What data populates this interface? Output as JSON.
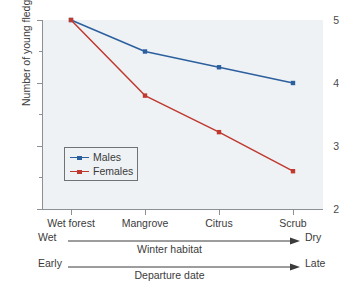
{
  "chart_data": {
    "type": "line",
    "title": "",
    "subtitle": "",
    "xlabel": "Winter habitat",
    "ylabel": "Number of young fledged",
    "categories": [
      "Wet forest",
      "Mangrove",
      "Citrus",
      "Scrub"
    ],
    "ylim": [
      2,
      5
    ],
    "yticks": [
      5,
      4,
      3,
      2
    ],
    "ytick_labels": [
      "5",
      "4",
      "3",
      "2"
    ],
    "yminor_ticks": [
      4.5,
      3.5,
      2.5
    ],
    "grid": false,
    "legend_position": "lower-left-inside",
    "series": [
      {
        "name": "Males",
        "color": "#2c5f9e",
        "values": [
          5.0,
          4.5,
          4.25,
          4.0
        ]
      },
      {
        "name": "Females",
        "color": "#c0392f",
        "values": [
          5.0,
          3.8,
          3.22,
          2.6
        ]
      }
    ],
    "annotations": [
      {
        "id": "winter-habitat",
        "start_label": "Wet",
        "end_label": "Dry",
        "mid_label": "Winter habitat"
      },
      {
        "id": "departure-date",
        "start_label": "Early",
        "end_label": "Late",
        "mid_label": "Departure date"
      }
    ]
  },
  "legend": {
    "entries": [
      {
        "label": "Males",
        "color": "#2c5f9e"
      },
      {
        "label": "Females",
        "color": "#c0392f"
      }
    ]
  },
  "axes": {
    "y_title": "Number of young fledged",
    "y_tick_labels": [
      "5",
      "4",
      "3",
      "2"
    ],
    "x_tick_labels": [
      "Wet forest",
      "Mangrove",
      "Citrus",
      "Scrub"
    ]
  },
  "annotations": {
    "habitat": {
      "start": "Wet",
      "end": "Dry",
      "middle": "Winter habitat"
    },
    "departure": {
      "start": "Early",
      "end": "Late",
      "middle": "Departure date"
    }
  },
  "colors": {
    "males": "#2c5f9e",
    "females": "#c0392f",
    "plot_background": "#eef2f5",
    "axis": "#8c9094",
    "text": "#3b3b3b",
    "page_background": "#ffffff"
  }
}
